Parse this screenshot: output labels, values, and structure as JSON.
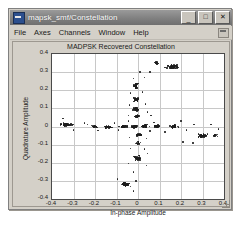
{
  "window": {
    "title": "mapsk_smf/Constellation",
    "app_icon": "simulink-scope-icon",
    "controls": {
      "minimize": "_",
      "maximize": "□",
      "close": "✕"
    }
  },
  "menu": {
    "items": [
      {
        "label": "File"
      },
      {
        "label": "Axes"
      },
      {
        "label": "Channels"
      },
      {
        "label": "Window"
      },
      {
        "label": "Help"
      }
    ],
    "dock_icon": "dock-window-icon"
  },
  "chart_data": {
    "type": "scatter",
    "title": "MADPSK Recovered Constellation",
    "xlabel": "In-phase Amplitude",
    "ylabel": "Quadrature Amplitude",
    "xlim": [
      -0.4,
      0.4
    ],
    "ylim": [
      -0.4,
      0.4
    ],
    "xticks": [
      -0.4,
      -0.3,
      -0.2,
      -0.1,
      0,
      0.1,
      0.2,
      0.3,
      0.4
    ],
    "yticks": [
      -0.4,
      -0.3,
      -0.2,
      -0.1,
      0,
      0.1,
      0.2,
      0.3,
      0.4
    ],
    "xticklabels": [
      "-0.4",
      "-0.3",
      "-0.2",
      "-0.1",
      "0",
      "0.1",
      "0.2",
      "0.3",
      "0.4"
    ],
    "yticklabels": [
      "-0.4",
      "-0.3",
      "-0.2",
      "-0.1",
      "0",
      "0.1",
      "0.2",
      "0.3",
      "0.4"
    ],
    "grid": true,
    "legend": null,
    "marker": {
      "style": "dot",
      "color": "#1c1c1c",
      "size": 1.6
    },
    "series": [
      {
        "name": "Recovered symbols",
        "description": "Cross-shaped MADPSK constellation: symbol clusters along the in-phase (horizontal) and quadrature (vertical) axes.",
        "clusters": [
          {
            "cx": -0.33,
            "cy": 0.01,
            "n": 42,
            "sx": 0.022,
            "sy": 0.008
          },
          {
            "cx": -0.205,
            "cy": 0.0,
            "n": 16,
            "sx": 0.016,
            "sy": 0.007
          },
          {
            "cx": -0.14,
            "cy": -0.002,
            "n": 34,
            "sx": 0.02,
            "sy": 0.007
          },
          {
            "cx": -0.065,
            "cy": 0.0,
            "n": 30,
            "sx": 0.018,
            "sy": 0.007
          },
          {
            "cx": -0.018,
            "cy": 0.0,
            "n": 38,
            "sx": 0.014,
            "sy": 0.007
          },
          {
            "cx": 0.03,
            "cy": 0.002,
            "n": 36,
            "sx": 0.016,
            "sy": 0.008
          },
          {
            "cx": 0.09,
            "cy": 0.0,
            "n": 26,
            "sx": 0.016,
            "sy": 0.007
          },
          {
            "cx": 0.165,
            "cy": 0.0,
            "n": 30,
            "sx": 0.018,
            "sy": 0.007
          },
          {
            "cx": 0.3,
            "cy": -0.052,
            "n": 40,
            "sx": 0.022,
            "sy": 0.01
          },
          {
            "cx": 0.36,
            "cy": -0.05,
            "n": 10,
            "sx": 0.012,
            "sy": 0.008
          },
          {
            "cx": 0.16,
            "cy": 0.33,
            "n": 46,
            "sx": 0.024,
            "sy": 0.012
          },
          {
            "cx": 0.09,
            "cy": 0.352,
            "n": 12,
            "sx": 0.012,
            "sy": 0.008
          },
          {
            "cx": -0.008,
            "cy": 0.225,
            "n": 32,
            "sx": 0.012,
            "sy": 0.014
          },
          {
            "cx": -0.01,
            "cy": 0.15,
            "n": 30,
            "sx": 0.013,
            "sy": 0.01
          },
          {
            "cx": -0.008,
            "cy": 0.095,
            "n": 28,
            "sx": 0.012,
            "sy": 0.009
          },
          {
            "cx": -0.006,
            "cy": 0.055,
            "n": 18,
            "sx": 0.01,
            "sy": 0.008
          },
          {
            "cx": 0.008,
            "cy": -0.045,
            "n": 26,
            "sx": 0.014,
            "sy": 0.009
          },
          {
            "cx": 0.0,
            "cy": -0.09,
            "n": 14,
            "sx": 0.01,
            "sy": 0.008
          },
          {
            "cx": -0.005,
            "cy": -0.175,
            "n": 36,
            "sx": 0.014,
            "sy": 0.014
          },
          {
            "cx": -0.055,
            "cy": -0.32,
            "n": 40,
            "sx": 0.02,
            "sy": 0.012
          }
        ],
        "stray_points": [
          {
            "x": -0.35,
            "y": 0.045
          },
          {
            "x": -0.3,
            "y": -0.02
          },
          {
            "x": -0.25,
            "y": 0.02
          },
          {
            "x": -0.235,
            "y": 0.012
          },
          {
            "x": -0.185,
            "y": -0.022
          },
          {
            "x": -0.11,
            "y": 0.018
          },
          {
            "x": -0.09,
            "y": -0.02
          },
          {
            "x": -0.045,
            "y": 0.03
          },
          {
            "x": 0.055,
            "y": -0.025
          },
          {
            "x": 0.075,
            "y": 0.022
          },
          {
            "x": 0.125,
            "y": -0.03
          },
          {
            "x": 0.2,
            "y": 0.03
          },
          {
            "x": 0.225,
            "y": -0.018
          },
          {
            "x": 0.26,
            "y": 0.01
          },
          {
            "x": 0.34,
            "y": 0.01
          },
          {
            "x": 0.375,
            "y": -0.015
          },
          {
            "x": 0.055,
            "y": 0.3
          },
          {
            "x": 0.03,
            "y": 0.27
          },
          {
            "x": 0.01,
            "y": 0.3
          },
          {
            "x": -0.02,
            "y": 0.265
          },
          {
            "x": 0.02,
            "y": 0.19
          },
          {
            "x": -0.035,
            "y": 0.185
          },
          {
            "x": 0.035,
            "y": 0.125
          },
          {
            "x": -0.04,
            "y": 0.12
          },
          {
            "x": 0.045,
            "y": 0.08
          },
          {
            "x": 0.06,
            "y": 0.06
          },
          {
            "x": -0.045,
            "y": 0.06
          },
          {
            "x": 0.04,
            "y": -0.065
          },
          {
            "x": -0.04,
            "y": -0.06
          },
          {
            "x": 0.03,
            "y": -0.125
          },
          {
            "x": -0.035,
            "y": -0.12
          },
          {
            "x": 0.045,
            "y": -0.15
          },
          {
            "x": -0.045,
            "y": -0.205
          },
          {
            "x": 0.04,
            "y": -0.215
          },
          {
            "x": -0.02,
            "y": -0.25
          },
          {
            "x": -0.095,
            "y": -0.29
          },
          {
            "x": -0.01,
            "y": -0.3
          },
          {
            "x": -0.02,
            "y": -0.355
          },
          {
            "x": 0.21,
            "y": -0.085
          },
          {
            "x": 0.255,
            "y": -0.09
          }
        ]
      }
    ]
  }
}
